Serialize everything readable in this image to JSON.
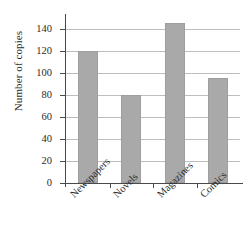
{
  "chart_data": {
    "type": "bar",
    "title": "",
    "subtitle": "",
    "xlabel": "",
    "ylabel": "Number of copies",
    "categories": [
      "Newspapers",
      "Novels",
      "Magazines",
      "Comics"
    ],
    "values": [
      120,
      80,
      145,
      95
    ],
    "ylim": [
      0,
      150
    ],
    "yticks": [
      0,
      20,
      40,
      60,
      80,
      100,
      120,
      140
    ],
    "ytick_labels": [
      "0",
      "20",
      "40",
      "60",
      "80",
      "100",
      "120",
      "140"
    ],
    "grid": true,
    "grid_axis": "y",
    "legend": false,
    "legend_position": "none",
    "bar_color": "#a9a9a9",
    "axis_color": "#4a4a4a",
    "grid_color": "#bdbdbd",
    "background_color": "#ffffff",
    "xtick_label_rotation": -45
  }
}
